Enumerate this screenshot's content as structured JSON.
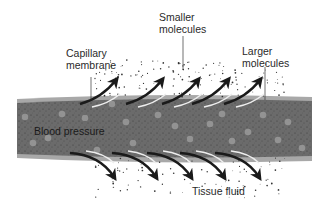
{
  "diagram": {
    "labels": {
      "capillary_membrane": [
        "Capillary",
        "membrane"
      ],
      "smaller_molecules": [
        "Smaller",
        "molecules"
      ],
      "larger_molecules": [
        "Larger",
        "molecules"
      ],
      "blood_pressure": "Blood pressure",
      "tissue_fluid": "Tissue fluid"
    },
    "colors": {
      "background": "#ffffff",
      "vessel_fill": "#6a6a6a",
      "membrane": "#a8a8a8",
      "molecule": "#9a9a9a",
      "arrow": "#1a1a1a",
      "text": "#2a2a2a"
    },
    "arrows_up_count": 5,
    "arrows_down_count": 5
  }
}
